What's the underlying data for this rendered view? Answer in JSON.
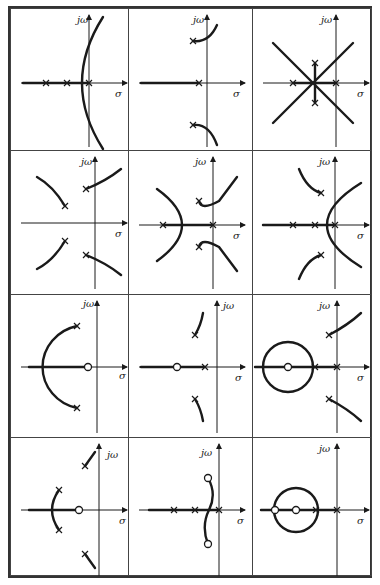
{
  "figure": {
    "axis_labels": {
      "imag": "jω",
      "real": "σ"
    },
    "line_color": "#1a1a1a",
    "panels": [
      {
        "id": "r1c1",
        "axis": {
          "x": 78,
          "y": 74
        },
        "paths": [
          "M12,74 L78,74",
          "M92,8 Q50,74 92,140"
        ],
        "poles": [
          [
            35,
            74
          ],
          [
            56,
            74
          ],
          [
            78,
            74
          ]
        ],
        "zeros": [],
        "jw_pos": [
          66,
          14
        ],
        "sig_pos": [
          104,
          88
        ]
      },
      {
        "id": "r1c2",
        "axis": {
          "x": 78,
          "y": 74
        },
        "paths": [
          "M12,74 L70,74",
          "M64,32 Q80,34 88,16",
          "M64,116 Q80,114 88,136"
        ],
        "poles": [
          [
            64,
            32
          ],
          [
            64,
            116
          ],
          [
            70,
            74
          ]
        ],
        "zeros": [],
        "jw_pos": [
          64,
          14
        ],
        "sig_pos": [
          104,
          88
        ]
      },
      {
        "id": "r1c3",
        "axis": {
          "x": 83,
          "y": 74
        },
        "paths": [
          "M20,34 L100,114",
          "M20,114 L100,34",
          "M62,54 L62,94",
          "M40,74 L83,74"
        ],
        "poles": [
          [
            40,
            74
          ],
          [
            62,
            54
          ],
          [
            62,
            94
          ],
          [
            83,
            74
          ]
        ],
        "zeros": [],
        "jw_pos": [
          68,
          14
        ],
        "sig_pos": [
          104,
          88
        ]
      },
      {
        "id": "r2c1",
        "axis": {
          "x": 84,
          "y": 72
        },
        "paths": [
          "M75,38 Q95,30 110,18",
          "M75,104 Q95,112 110,124",
          "M54,55 Q42,35 26,26",
          "M54,90 Q42,110 26,118"
        ],
        "poles": [
          [
            75,
            38
          ],
          [
            75,
            104
          ],
          [
            54,
            55
          ],
          [
            54,
            90
          ]
        ],
        "zeros": [],
        "jw_pos": [
          70,
          14
        ],
        "sig_pos": [
          104,
          86
        ]
      },
      {
        "id": "r2c2",
        "axis": {
          "x": 84,
          "y": 74
        },
        "paths": [
          "M34,74 L84,74",
          "M28,38 Q78,74 28,110",
          "M70,50 Q72,60 90,50 L108,26",
          "M70,96 Q72,86 90,96 L108,120"
        ],
        "poles": [
          [
            34,
            74
          ],
          [
            70,
            50
          ],
          [
            70,
            96
          ],
          [
            84,
            74
          ]
        ],
        "zeros": [],
        "jw_pos": [
          66,
          14
        ],
        "sig_pos": [
          104,
          88
        ]
      },
      {
        "id": "r2c3",
        "axis": {
          "x": 82,
          "y": 74
        },
        "paths": [
          "M10,74 L82,74",
          "M108,32 Q40,74 108,116",
          "M46,18 Q54,38 68,42",
          "M46,128 Q54,108 68,104"
        ],
        "poles": [
          [
            40,
            74
          ],
          [
            62,
            74
          ],
          [
            82,
            74
          ],
          [
            68,
            42
          ],
          [
            68,
            104
          ]
        ],
        "zeros": [],
        "jw_pos": [
          66,
          14
        ],
        "sig_pos": [
          104,
          88
        ]
      },
      {
        "id": "r3c1",
        "axis": {
          "x": 86,
          "y": 72
        },
        "paths": [
          "M18,72 L77,72",
          "M66,31 A44,42 0 0 0 66,113"
        ],
        "poles": [
          [
            66,
            31
          ],
          [
            66,
            113
          ]
        ],
        "zeros": [
          [
            77,
            72
          ]
        ],
        "jw_pos": [
          72,
          12
        ],
        "sig_pos": [
          108,
          84
        ]
      },
      {
        "id": "r3c2",
        "axis": {
          "x": 88,
          "y": 72
        },
        "paths": [
          "M12,72 L46,72",
          "M50,72 L76,72",
          "M66,40 Q72,30 74,18",
          "M66,104 Q72,114 74,126"
        ],
        "poles": [
          [
            66,
            40
          ],
          [
            66,
            104
          ],
          [
            76,
            72
          ]
        ],
        "zeros": [
          [
            48,
            72
          ]
        ],
        "jw_pos": [
          94,
          14
        ],
        "sig_pos": [
          106,
          86
        ]
      },
      {
        "id": "r3c3",
        "axis": {
          "x": 84,
          "y": 72
        },
        "paths": [
          "M2,72 L84,72",
          "M35,72 m-25,0 a25,25 0 1 0 50,0 a25,25 0 1 0 -50,0",
          "M76,40 Q95,30 108,18",
          "M76,104 Q95,114 108,126"
        ],
        "poles": [
          [
            62,
            72
          ],
          [
            84,
            72
          ],
          [
            76,
            40
          ],
          [
            76,
            104
          ]
        ],
        "zeros": [
          [
            35,
            72
          ]
        ],
        "jw_pos": [
          66,
          14
        ],
        "sig_pos": [
          104,
          86
        ]
      },
      {
        "id": "r4c1",
        "axis": {
          "x": 88,
          "y": 72
        },
        "paths": [
          "M18,72 L66,72",
          "M48,52 Q34,72 48,92",
          "M74,28 L84,14",
          "M74,116 L84,130"
        ],
        "poles": [
          [
            48,
            52
          ],
          [
            48,
            92
          ],
          [
            74,
            28
          ],
          [
            74,
            116
          ]
        ],
        "zeros": [
          [
            68,
            72
          ]
        ],
        "jw_pos": [
          96,
          20
        ],
        "sig_pos": [
          108,
          86
        ]
      },
      {
        "id": "r4c2",
        "axis": {
          "x": 90,
          "y": 72
        },
        "paths": [
          "M20,72 L90,72",
          "M79,40 Q88,56 80,72 Q72,88 79,106"
        ],
        "poles": [
          [
            45,
            72
          ],
          [
            66,
            72
          ],
          [
            90,
            72
          ]
        ],
        "zeros": [
          [
            79,
            40
          ],
          [
            79,
            106
          ]
        ],
        "jw_pos": [
          72,
          18
        ],
        "sig_pos": [
          108,
          86
        ]
      },
      {
        "id": "r4c3",
        "axis": {
          "x": 84,
          "y": 72
        },
        "paths": [
          "M8,72 L84,72",
          "M43,72 m-22,0 a22,22 0 1 0 44,0 a22,22 0 1 0 -44,0"
        ],
        "poles": [
          [
            63,
            72
          ],
          [
            84,
            72
          ]
        ],
        "zeros": [
          [
            22,
            72
          ],
          [
            43,
            72
          ]
        ],
        "jw_pos": [
          66,
          14
        ],
        "sig_pos": [
          104,
          86
        ]
      }
    ]
  }
}
